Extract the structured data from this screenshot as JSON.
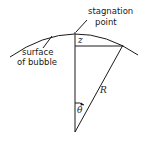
{
  "diagram": {
    "labels": {
      "stagnation_line1": "stagnation",
      "stagnation_line2": "point",
      "surface_line1": "surface",
      "surface_line2": "of bubble",
      "height": "z",
      "radius": "R",
      "angle": "θ"
    },
    "colors": {
      "stroke": "#1a1a1a",
      "background": "#ffffff"
    }
  }
}
